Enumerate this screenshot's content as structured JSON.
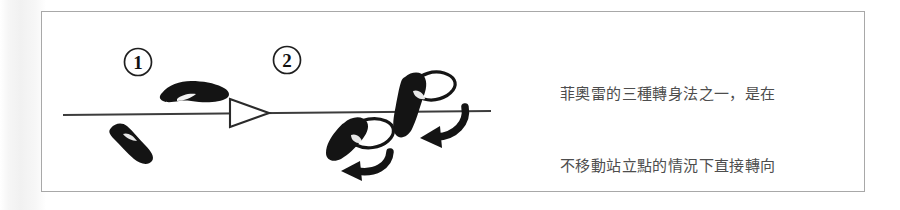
{
  "figure": {
    "caption_lines": [
      "菲奧雷的三種轉身法之一，是在",
      "不移動站立點的情況下直接轉向",
      "相反側。"
    ],
    "caption_full": "菲奧雷的三種轉身法之一，是在不移動站立點的情況下直接轉向相反側。",
    "step_labels": [
      "1",
      "2"
    ],
    "colors": {
      "frame_border": "#a8a8a8",
      "background": "#ffffff",
      "ink": "#1a1a1a",
      "caption_text": "#4d4d4d",
      "guide_line": "#3c3c3c"
    },
    "icons": {
      "step_marker_1": "circled-number-one-icon",
      "step_marker_2": "circled-number-two-icon",
      "direction_marker": "hollow-triangle-right-icon",
      "footprint_filled": "filled-footprint-icon",
      "footprint_outline": "outline-footprint-icon",
      "rotation_arrow": "curved-rotation-arrow-icon",
      "guide_line": "horizontal-guide-line-icon",
      "page_bleed": "page-bleed-artifact-icon"
    }
  }
}
